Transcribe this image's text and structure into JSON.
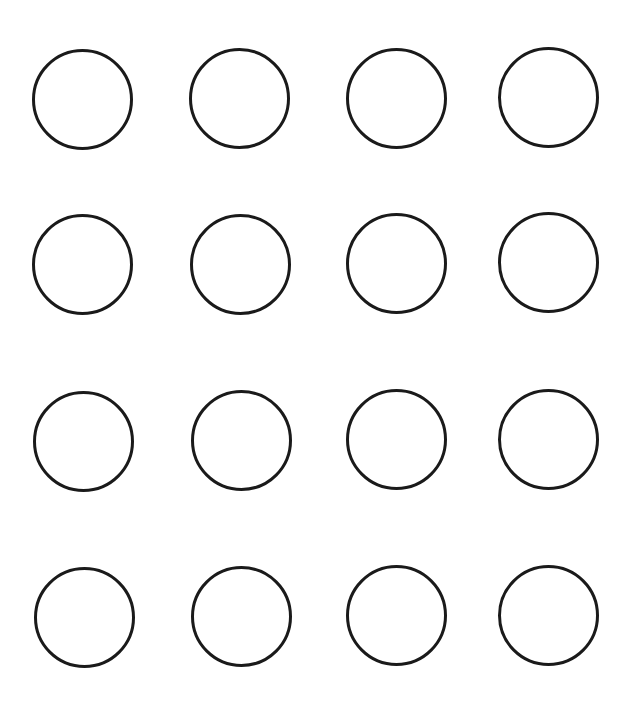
{
  "diagram": {
    "type": "circle-grid",
    "rows": 4,
    "columns": 4,
    "stroke_color": "#1a1a1a",
    "background_color": "#ffffff",
    "circles": [
      {
        "row": 1,
        "col": 1,
        "cx": 82,
        "cy": 99
      },
      {
        "row": 1,
        "col": 2,
        "cx": 239,
        "cy": 98
      },
      {
        "row": 1,
        "col": 3,
        "cx": 396,
        "cy": 98
      },
      {
        "row": 1,
        "col": 4,
        "cx": 548,
        "cy": 97
      },
      {
        "row": 2,
        "col": 1,
        "cx": 82,
        "cy": 264
      },
      {
        "row": 2,
        "col": 2,
        "cx": 240,
        "cy": 264
      },
      {
        "row": 2,
        "col": 3,
        "cx": 396,
        "cy": 263
      },
      {
        "row": 2,
        "col": 4,
        "cx": 548,
        "cy": 262
      },
      {
        "row": 3,
        "col": 1,
        "cx": 83,
        "cy": 441
      },
      {
        "row": 3,
        "col": 2,
        "cx": 241,
        "cy": 440
      },
      {
        "row": 3,
        "col": 3,
        "cx": 396,
        "cy": 439
      },
      {
        "row": 3,
        "col": 4,
        "cx": 548,
        "cy": 439
      },
      {
        "row": 4,
        "col": 1,
        "cx": 84,
        "cy": 617
      },
      {
        "row": 4,
        "col": 2,
        "cx": 241,
        "cy": 616
      },
      {
        "row": 4,
        "col": 3,
        "cx": 396,
        "cy": 615
      },
      {
        "row": 4,
        "col": 4,
        "cx": 548,
        "cy": 615
      }
    ]
  }
}
